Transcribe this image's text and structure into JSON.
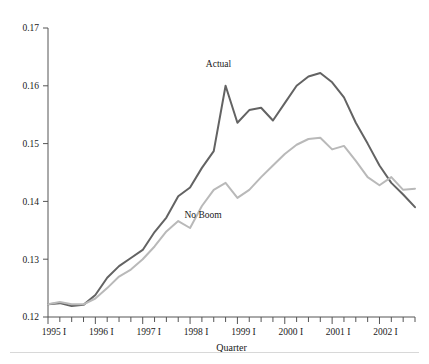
{
  "chart_data": {
    "type": "line",
    "title": "",
    "xlabel": "Quarter",
    "ylabel": "",
    "ylim": [
      0.12,
      0.17
    ],
    "yticks": [
      0.12,
      0.13,
      0.14,
      0.15,
      0.16,
      0.17
    ],
    "ytick_labels": [
      "0.12",
      "0.13",
      "0.14",
      "0.15",
      "0.16",
      "0.17"
    ],
    "grid": false,
    "legend_position": "inline-annotation",
    "x": [
      "1995 I",
      "1995 II",
      "1995 III",
      "1995 IV",
      "1996 I",
      "1996 II",
      "1996 III",
      "1996 IV",
      "1997 I",
      "1997 II",
      "1997 III",
      "1997 IV",
      "1998 I",
      "1998 II",
      "1998 III",
      "1998 IV",
      "1999 I",
      "1999 II",
      "1999 III",
      "1999 IV",
      "2000 I",
      "2000 II",
      "2000 III",
      "2000 IV",
      "2001 I",
      "2001 II",
      "2001 III",
      "2001 IV",
      "2002 I",
      "2002 II",
      "2002 III",
      "2002 IV"
    ],
    "xtick_labels": [
      "1995 I",
      "1996 I",
      "1997 I",
      "1998 I",
      "1999 I",
      "2000 I",
      "2001 I",
      "2002 I"
    ],
    "xtick_label_indices": [
      0,
      4,
      8,
      12,
      16,
      20,
      24,
      28
    ],
    "series": [
      {
        "name": "Actual",
        "color": "#636363",
        "label_x_index": 14.4,
        "label_y_value": 0.1632,
        "values": [
          0.1222,
          0.1224,
          0.1219,
          0.1221,
          0.1238,
          0.1268,
          0.1288,
          0.1302,
          0.1316,
          0.1347,
          0.1372,
          0.1409,
          0.1424,
          0.1458,
          0.1487,
          0.16,
          0.1536,
          0.1558,
          0.1562,
          0.154,
          0.157,
          0.16,
          0.1616,
          0.1622,
          0.1606,
          0.158,
          0.1536,
          0.15,
          0.1462,
          0.1432,
          0.1412,
          0.139
        ]
      },
      {
        "name": "No Boom",
        "color": "#b9b9b9",
        "label_x_index": 13.1,
        "label_y_value": 0.1372,
        "values": [
          0.1222,
          0.1226,
          0.1222,
          0.1222,
          0.1232,
          0.125,
          0.127,
          0.1282,
          0.13,
          0.1322,
          0.1348,
          0.1366,
          0.1354,
          0.1392,
          0.142,
          0.1432,
          0.1406,
          0.142,
          0.1442,
          0.1462,
          0.1482,
          0.1498,
          0.1508,
          0.151,
          0.149,
          0.1496,
          0.147,
          0.1442,
          0.1428,
          0.1442,
          0.142,
          0.1422
        ]
      }
    ]
  }
}
